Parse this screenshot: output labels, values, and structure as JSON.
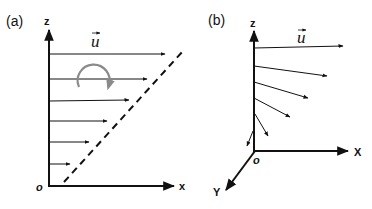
{
  "panel_a": {
    "label": "(a)",
    "axes": {
      "z": "z",
      "x": "x",
      "origin": "o"
    },
    "vector_label": "u",
    "velocity_profile": "linear shear",
    "arrows": [
      {
        "y": 54,
        "x_end": 165
      },
      {
        "y": 79,
        "x_end": 147
      },
      {
        "y": 101,
        "x_end": 129
      },
      {
        "y": 121,
        "x_end": 107
      },
      {
        "y": 142,
        "x_end": 89
      },
      {
        "y": 164,
        "x_end": 70
      }
    ],
    "rotation_indicator": "clockwise curved arrow",
    "dashed_line": "profile envelope"
  },
  "panel_b": {
    "label": "(b)",
    "axes": {
      "z": "z",
      "x": "X",
      "y": "Y",
      "origin": "o"
    },
    "vector_label": "u",
    "velocity_profile": "Ekman spiral",
    "arrows": [
      {
        "y0": 48,
        "x1": 343,
        "y1": 45
      },
      {
        "y0": 65,
        "x1": 327,
        "y1": 75
      },
      {
        "y0": 80,
        "x1": 308,
        "y1": 97
      },
      {
        "y0": 97,
        "x1": 290,
        "y1": 116
      },
      {
        "y0": 113,
        "x1": 268,
        "y1": 135
      },
      {
        "y0": 130,
        "x1": 247,
        "y1": 145
      }
    ]
  },
  "colors": {
    "line": "#111111",
    "rotation_arrow": "#8a8a8a",
    "background": "#ffffff"
  }
}
